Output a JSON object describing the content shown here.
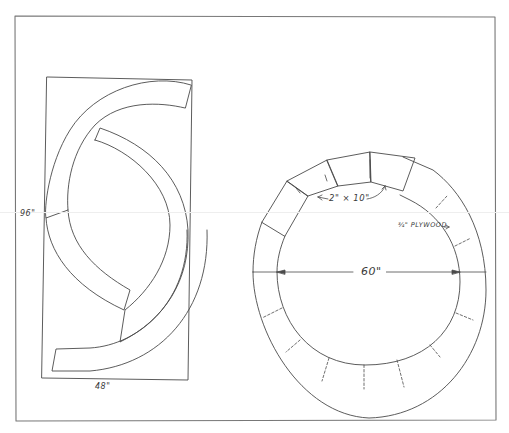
{
  "figure": {
    "type": "woodworking plan drawing",
    "stroke_color": "#4a4a4a",
    "background": "#ffffff"
  },
  "left_panel": {
    "description": "S-shaped ring segments cut from a plywood sheet",
    "sheet_height_label": "96\"",
    "sheet_width_label": "48\""
  },
  "right_panel": {
    "description": "Circular ring assembled from segments",
    "diameter_label": "60\"",
    "frame_member_label": "2\" × 10\"",
    "sheathing_label": "¾\" PLYWOOD"
  }
}
